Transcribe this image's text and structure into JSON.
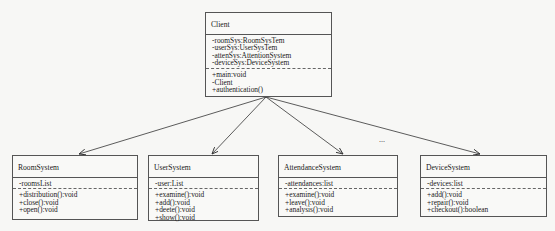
{
  "diagram": {
    "type": "UML class diagram",
    "classes": {
      "client": {
        "name": "Client",
        "attributes": [
          "-roomSys:RoomSysTem",
          "-userSys:UserSysTem",
          "-attenSys:AttentionSystem",
          "-deviceSys:DeviceSystem"
        ],
        "operations": [
          "+main:void",
          "-Client",
          "+authentication()"
        ]
      },
      "room": {
        "name": "RoomSystem",
        "attributes": [
          "-roomsList"
        ],
        "operations": [
          "+distribution():void",
          "+close():void",
          "+open():void"
        ]
      },
      "user": {
        "name": "UserSystem",
        "attributes": [
          "-user:List"
        ],
        "operations": [
          "+examine():void",
          "+add():void",
          "+deete():void",
          "+show():void"
        ]
      },
      "attendance": {
        "name": "AttendanceSystem",
        "attributes": [
          "-attendances:list"
        ],
        "operations": [
          "+examine():void",
          "+leave():void",
          "+analysis():void"
        ]
      },
      "device": {
        "name": "DeviceSystem",
        "attributes": [
          "-devices:list"
        ],
        "operations": [
          "+add():void",
          "+repair():void",
          "+checkout():boolean"
        ]
      }
    },
    "relations": [
      {
        "from": "Client",
        "to": "RoomSystem",
        "kind": "association-arrow"
      },
      {
        "from": "Client",
        "to": "UserSystem",
        "kind": "association-arrow"
      },
      {
        "from": "Client",
        "to": "AttendanceSystem",
        "kind": "association-arrow"
      },
      {
        "from": "Client",
        "to": "DeviceSystem",
        "kind": "association-arrow"
      }
    ],
    "ellipsis": "..."
  }
}
